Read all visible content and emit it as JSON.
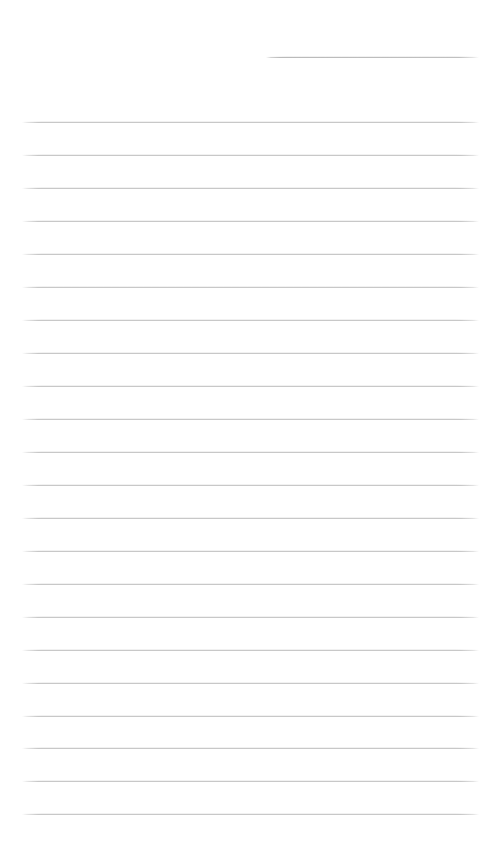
{
  "page": {
    "title": "Ruled Writing Page",
    "width": 498,
    "height": 849,
    "background_color": "#ffffff"
  },
  "ruling": {
    "line_color": "#c8c8c8",
    "line_thickness_px": 1,
    "line_spacing_px": 33,
    "left_margin_px": 22,
    "right_edge_px": 479,
    "header_rule": {
      "name": "header-rule",
      "x_start": 266,
      "x_end": 479,
      "y": 57,
      "color": "#bebebe"
    },
    "body_rules": [
      {
        "y": 122
      },
      {
        "y": 155
      },
      {
        "y": 188
      },
      {
        "y": 221
      },
      {
        "y": 254
      },
      {
        "y": 287
      },
      {
        "y": 320
      },
      {
        "y": 353
      },
      {
        "y": 386
      },
      {
        "y": 419
      },
      {
        "y": 452
      },
      {
        "y": 485
      },
      {
        "y": 518
      },
      {
        "y": 551
      },
      {
        "y": 584
      },
      {
        "y": 617
      },
      {
        "y": 650
      },
      {
        "y": 683
      },
      {
        "y": 716
      },
      {
        "y": 748
      },
      {
        "y": 781
      },
      {
        "y": 814
      }
    ],
    "body_rule_count": 22,
    "total_rule_count": 23
  },
  "content": {
    "written_text": "",
    "is_blank": true
  }
}
